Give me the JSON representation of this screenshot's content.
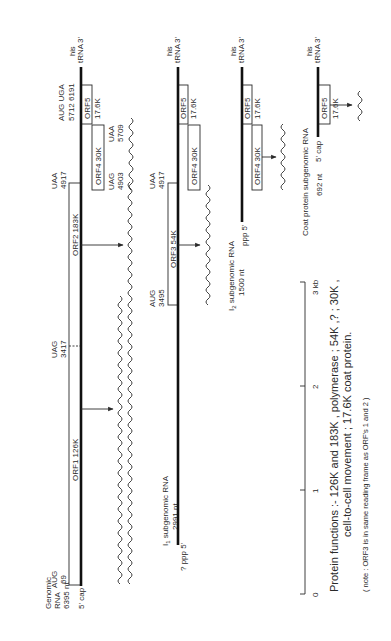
{
  "figure": {
    "genomic": {
      "title_line1": "Genomic",
      "title_line2": "RNA",
      "title_line3": "6395 nt",
      "cap5": "5' cap",
      "end3": "3'",
      "trna": "tRNA",
      "his": "his",
      "aug69_codon": "AUG",
      "aug69_pos": "69",
      "uag3417_codon": "UAG",
      "uag3417_pos": "3417",
      "uaa4917_codon": "UAA",
      "uaa4917_pos": "4917",
      "uag4903_codon": "UAG",
      "uag4903_pos": "4903",
      "uaa5709_codon": "UAA",
      "uaa5709_pos": "5709",
      "aug_uga_codons": "AUG UGA",
      "aug_uga_pos": "5712 6191",
      "orf1": "ORF1  126K",
      "orf2": "ORF2  183K",
      "orf4": "ORF4  30K",
      "orf5": "ORF5",
      "orf5_mass": "17.6K"
    },
    "i1": {
      "title_prefix": "I",
      "title_sub": "1",
      "title_rest": " subgenomic RNA",
      "length": "2991 nt",
      "end5": "? ppp 5'",
      "end3": "3'",
      "trna": "tRNA",
      "his": "his",
      "aug_codon": "AUG",
      "aug_pos": "3495",
      "uaa_codon": "UAA",
      "uaa_pos": "4917",
      "orf3": "ORF3  54K",
      "orf4": "ORF4  30K",
      "orf5": "ORF5",
      "orf5_mass": "17.6K"
    },
    "i2": {
      "title_prefix": "I",
      "title_sub": "2",
      "title_rest": " subgenomic RNA",
      "length": "1500 nt",
      "end5": "ppp 5'",
      "end3": "3'",
      "trna": "tRNA",
      "his": "his",
      "orf4": "ORF4  30K",
      "orf5": "ORF5",
      "orf5_mass": "17.6K"
    },
    "coat": {
      "title": "Coat protein subgenomic RNA",
      "length": "692 nt",
      "cap5": "5' cap",
      "end3": "3'",
      "trna": "tRNA",
      "his": "his",
      "orf5": "ORF5",
      "orf5_mass": "17.6K"
    },
    "scale": {
      "ticks": [
        "0",
        "1",
        "2",
        "3 kb"
      ]
    },
    "functions": {
      "line1": "Protein functions :-  126K and 183K , polymerase ; 54K ,? ; 30K ,",
      "line2": "cell-to-cell movement ; 17.6K coat protein.",
      "note": "( note : ORF3 is in same reading frame as ORF's 1 and 2 )"
    }
  }
}
